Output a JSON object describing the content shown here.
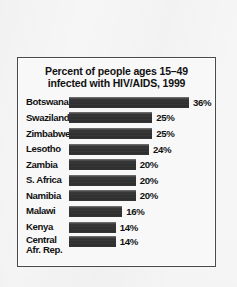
{
  "chart_data": {
    "type": "bar",
    "title": "Percent of people ages 15–49 infected with HIV/AIDS, 1999",
    "title_lines": [
      "Percent of people ages 15–49",
      "infected with HIV/AIDS, 1999"
    ],
    "orientation": "horizontal",
    "xlabel": "",
    "ylabel": "",
    "xlim": [
      0,
      36
    ],
    "grid": false,
    "legend": false,
    "categories": [
      "Botswana",
      "Swaziland",
      "Zimbabwe",
      "Lesotho",
      "Zambia",
      "S. Africa",
      "Namibia",
      "Malawi",
      "Kenya",
      "Central Afr. Rep."
    ],
    "values": [
      36,
      25,
      25,
      24,
      20,
      20,
      20,
      16,
      14,
      14
    ],
    "value_labels": [
      "36%",
      "25%",
      "25%",
      "24%",
      "20%",
      "20%",
      "20%",
      "16%",
      "14%",
      "14%"
    ],
    "rows": [
      {
        "label": "Botswana",
        "label_line2": "",
        "value": 36,
        "value_label": "36%"
      },
      {
        "label": "Swaziland",
        "label_line2": "",
        "value": 25,
        "value_label": "25%"
      },
      {
        "label": "Zimbabwe",
        "label_line2": "",
        "value": 25,
        "value_label": "25%"
      },
      {
        "label": "Lesotho",
        "label_line2": "",
        "value": 24,
        "value_label": "24%"
      },
      {
        "label": "Zambia",
        "label_line2": "",
        "value": 20,
        "value_label": "20%"
      },
      {
        "label": "S. Africa",
        "label_line2": "",
        "value": 20,
        "value_label": "20%"
      },
      {
        "label": "Namibia",
        "label_line2": "",
        "value": 20,
        "value_label": "20%"
      },
      {
        "label": "Malawi",
        "label_line2": "",
        "value": 16,
        "value_label": "16%"
      },
      {
        "label": "Kenya",
        "label_line2": "",
        "value": 14,
        "value_label": "14%"
      },
      {
        "label": "Central",
        "label_line2": "Afr. Rep.",
        "value": 14,
        "value_label": "14%"
      }
    ],
    "colors": {
      "bar": "#333333",
      "text": "#111111",
      "background": "#f6f6f6",
      "frame": "#4a4a4a"
    }
  }
}
